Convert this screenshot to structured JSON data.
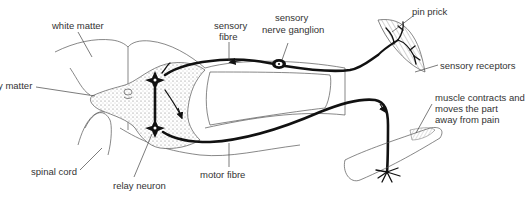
{
  "diagram": {
    "type": "reflex-arc",
    "labels": {
      "white_matter": "white matter",
      "grey_matter": "y matter",
      "spinal_cord": "spinal cord",
      "relay_neuron": "relay neuron",
      "sensory_fibre_1": "sensory",
      "sensory_fibre_2": "fibre",
      "ganglion_1": "sensory",
      "ganglion_2": "nerve ganglion",
      "motor_fibre": "motor fibre",
      "pin_prick": "pin prick",
      "sensory_receptors": "sensory receptors",
      "muscle_1": "muscle contracts and",
      "muscle_2": "moves the part",
      "muscle_3": "away from pain"
    },
    "colors": {
      "nerve": "#111111",
      "outline": "#555555",
      "text": "#333333",
      "background": "#ffffff"
    }
  }
}
